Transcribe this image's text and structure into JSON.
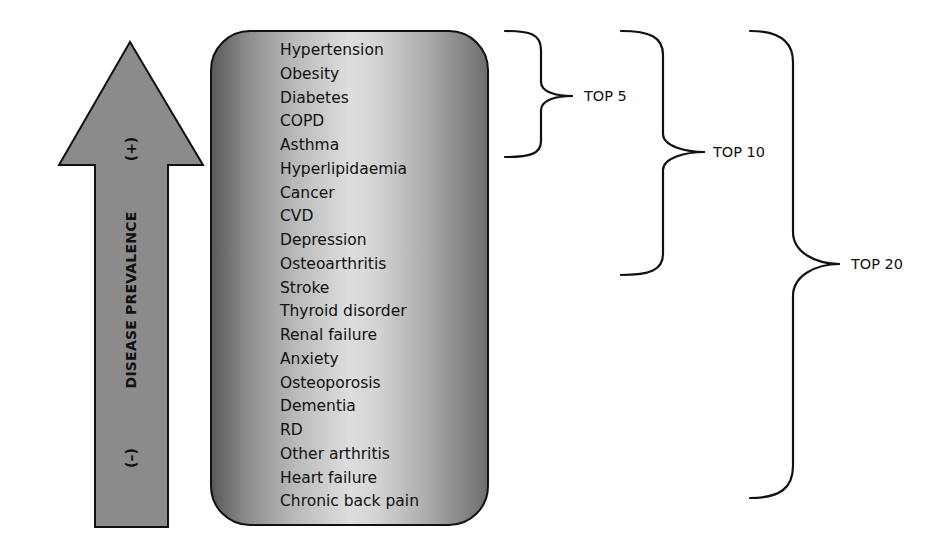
{
  "arrow": {
    "label": "DISEASE PREVALENCE",
    "high_sign": "(+)",
    "low_sign": "(–)",
    "fill_color": "#8b8b8b",
    "direction": "up"
  },
  "diseases": [
    "Hypertension",
    "Obesity",
    "Diabetes",
    "COPD",
    "Asthma",
    "Hyperlipidaemia",
    "Cancer",
    "CVD",
    "Depression",
    "Osteoarthritis",
    "Stroke",
    "Thyroid disorder",
    "Renal failure",
    "Anxiety",
    "Osteoporosis",
    "Dementia",
    "RD",
    "Other arthritis",
    "Heart failure",
    "Chronic back pain"
  ],
  "groups": [
    {
      "label": "TOP 5",
      "from_item": 1,
      "to_item": 5
    },
    {
      "label": "TOP 10",
      "from_item": 1,
      "to_item": 10
    },
    {
      "label": "TOP 20",
      "from_item": 1,
      "to_item": 20
    }
  ]
}
